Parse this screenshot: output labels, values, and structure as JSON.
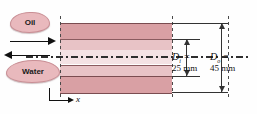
{
  "figure": {
    "labels": {
      "oil": "Oil",
      "water": "Water",
      "axis_x": "x"
    },
    "dimensions": [
      {
        "id": "inner-diameter",
        "symbol": "D",
        "subscript": "i",
        "equals": "=",
        "value": "25 mm",
        "symbol_text": "D",
        "full_text": "Di = 25 mm"
      },
      {
        "id": "outer-diameter",
        "symbol": "D",
        "subscript": "o",
        "equals": "=",
        "value": "45 mm",
        "symbol_text": "D",
        "full_text": "Do = 45 mm"
      }
    ],
    "colors": {
      "outer_wall": "#d9a0a4",
      "annulus_fluid": "#e8c3c6",
      "inner_core": "#f4e2e4",
      "blob_fill": "#e9b9bd",
      "line": "#333333"
    }
  }
}
